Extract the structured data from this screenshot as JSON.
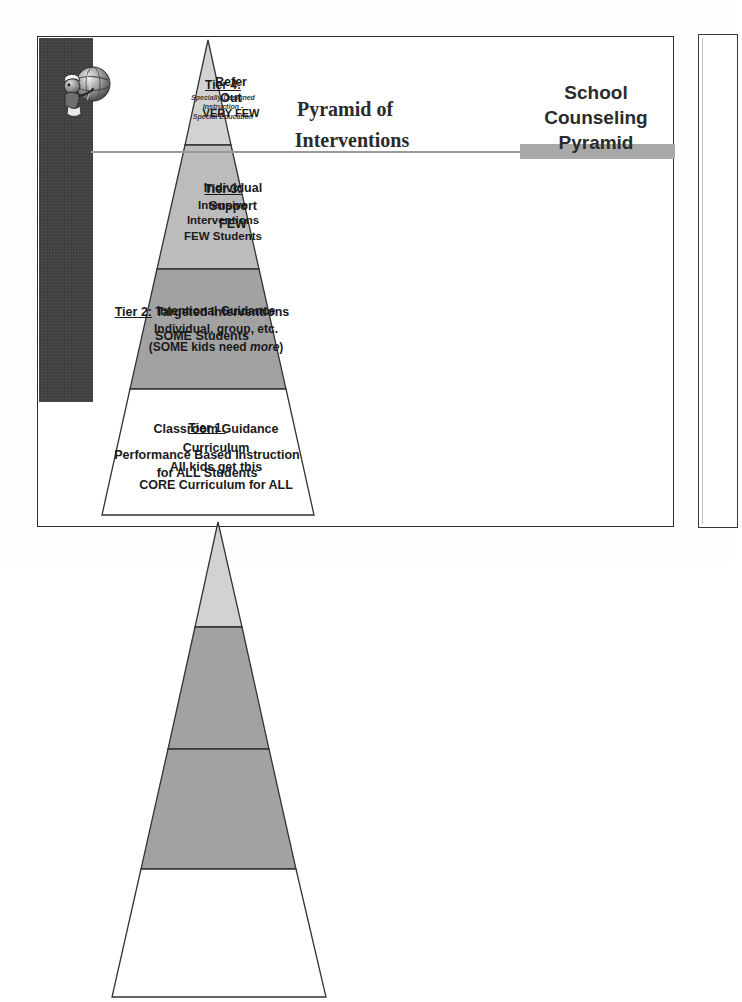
{
  "slide": {
    "headings": {
      "interventions_line1": "Pyramid of",
      "interventions_line2": "Interventions",
      "counseling_line1": "School",
      "counseling_line2": "Counseling",
      "counseling_line3": "Pyramid"
    },
    "left_pyramid": {
      "name": "Pyramid of Interventions",
      "tiers": [
        {
          "level": "Tier 4:",
          "sub_line1": "Specially Designed",
          "sub_line2": "Instruction -",
          "sub_line3": "Special Education",
          "fill": "#d2d2d2"
        },
        {
          "level": "Tier 3:",
          "line1": "Intensive",
          "line2": "Interventions",
          "line3": "FEW Students",
          "fill": "#bcbcbc"
        },
        {
          "level": "Tier 2:",
          "heading_rest": " Targeted Interventions",
          "line1": "SOME Students",
          "fill": "#a2a2a2"
        },
        {
          "level": "Tier 1:",
          "line1": "Performance Based Instruction",
          "line2": "for ALL Students",
          "fill": "#ffffff"
        }
      ]
    },
    "right_pyramid": {
      "name": "School Counseling Pyramid",
      "tiers": [
        {
          "line1": "Refer",
          "line2": "Out",
          "line3": "VERY FEW",
          "fill": "#d2d2d2"
        },
        {
          "line1": "Individual",
          "line2": "Support",
          "line3": "FEW",
          "fill": "#a2a2a2"
        },
        {
          "line1": "Intentional Guidance",
          "line2": "Individual, group, etc.",
          "line3_pre": "(SOME kids need ",
          "line3_em": "more",
          "line3_post": ")",
          "fill": "#a2a2a2"
        },
        {
          "line1": "Classroom Guidance",
          "line2": "Curriculum",
          "line3": "All kids get this",
          "line4": "CORE Curriculum for ALL",
          "fill": "#ffffff"
        }
      ]
    },
    "colors": {
      "dark_bar": "#3e3e3e",
      "divider_line": "#9a9a9a",
      "highlight_bar": "#a8a8a8",
      "outline": "#333333",
      "page_border": "#2e2e2e"
    }
  }
}
